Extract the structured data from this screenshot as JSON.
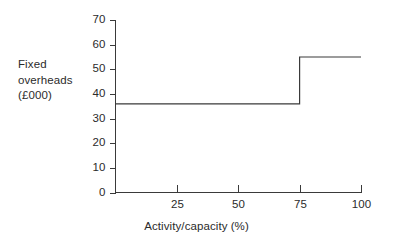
{
  "figure": {
    "y_axis_caption_lines": [
      "Fixed",
      "overheads",
      "(£000)"
    ],
    "x_axis_title": "Activity/capacity",
    "x_axis_unit": "(%)"
  },
  "chart_data": {
    "type": "line",
    "subtype": "step",
    "title": "",
    "xlabel": "Activity/capacity (%)",
    "ylabel": "Fixed overheads (£000)",
    "xlim": [
      0,
      100
    ],
    "ylim": [
      0,
      70
    ],
    "grid": false,
    "legend": null,
    "x_ticks": [
      25,
      50,
      75,
      100
    ],
    "x_tick_labels": [
      "25",
      "50",
      "75",
      "100"
    ],
    "y_ticks": [
      0,
      10,
      20,
      30,
      40,
      50,
      60,
      70
    ],
    "y_tick_labels": [
      "0",
      "10",
      "20",
      "30",
      "40",
      "50",
      "60",
      "70"
    ],
    "x_tick_direction": "up",
    "y_tick_direction": "left",
    "series": [
      {
        "name": "Fixed overheads",
        "color": "#3a3a3a",
        "step": "post",
        "points": [
          {
            "x": 0,
            "y": 36
          },
          {
            "x": 75,
            "y": 36
          },
          {
            "x": 75,
            "y": 55
          },
          {
            "x": 100,
            "y": 55
          }
        ]
      }
    ],
    "steps": [
      {
        "x_from": 0,
        "x_to": 75,
        "value": 36
      },
      {
        "x_from": 75,
        "x_to": 100,
        "value": 55
      }
    ]
  },
  "colors": {
    "background": "#ffffff",
    "ink": "#2b2b2b",
    "line": "#3a3a3a"
  }
}
